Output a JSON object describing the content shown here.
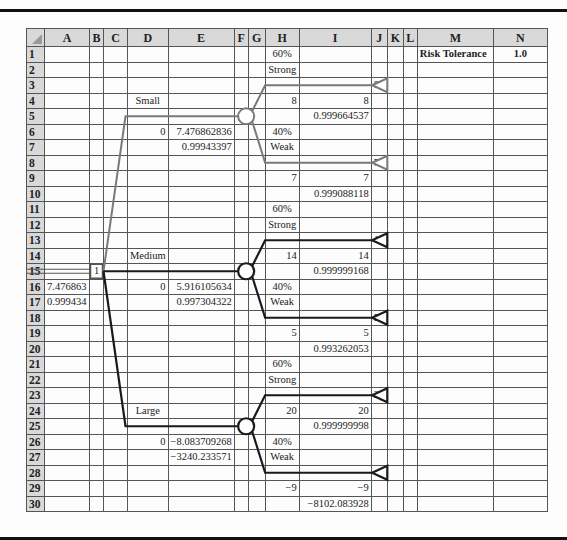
{
  "columns": [
    "A",
    "B",
    "C",
    "D",
    "E",
    "F",
    "G",
    "H",
    "I",
    "J",
    "K",
    "L",
    "M",
    "N"
  ],
  "risk": {
    "label": "Risk Tolerance",
    "value": "1.0"
  },
  "cells": {
    "H1": "60%",
    "H2": "Strong",
    "J3": "8",
    "D4": "Small",
    "H4": "8",
    "I4": "8",
    "I5": "0.999664537",
    "D6": "0",
    "E6": "7.476862836",
    "H6": "40%",
    "E7": "0.99943397",
    "H7": "Weak",
    "J8": "7",
    "H9": "7",
    "I9": "7",
    "I10": "0.999088118",
    "H11": "60%",
    "H12": "Strong",
    "J13": "14",
    "D14": "Medium",
    "H14": "14",
    "I14": "14",
    "B15": "1",
    "I15": "0.999999168",
    "A16": "7.476863",
    "D16": "0",
    "E16": "5.916105634",
    "H16": "40%",
    "A17": "0.999434",
    "E17": "0.997304322",
    "H17": "Weak",
    "J18": "5",
    "H19": "5",
    "I19": "5",
    "I20": "0.993262053",
    "H21": "60%",
    "H22": "Strong",
    "J23": "20",
    "D24": "Large",
    "H24": "20",
    "I24": "20",
    "I25": "0.999999998",
    "D26": "0",
    "E26": "−8.083709268",
    "H26": "40%",
    "E27": "−3240.233571",
    "H27": "Weak",
    "J28": "−9",
    "H29": "−9",
    "I29": "−9",
    "I30": "−8102.083928"
  },
  "tree": {
    "decision": {
      "label": "1",
      "row": 15
    },
    "branches": [
      {
        "name": "Small",
        "color": "#7a7a7a",
        "node_row": 5,
        "up_row": 3,
        "down_row": 8,
        "up_payoff": "8",
        "down_payoff": "7"
      },
      {
        "name": "Medium",
        "color": "#1a1a1a",
        "node_row": 15,
        "up_row": 13,
        "down_row": 18,
        "up_payoff": "14",
        "down_payoff": "5"
      },
      {
        "name": "Large",
        "color": "#1a1a1a",
        "node_row": 25,
        "up_row": 23,
        "down_row": 28,
        "up_payoff": "20",
        "down_payoff": "-9"
      }
    ]
  }
}
